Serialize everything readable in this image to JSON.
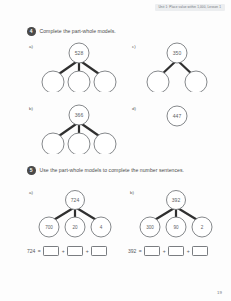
{
  "header": {
    "running_head": "Unit 1: Place value within 1,000, Lesson 1"
  },
  "footer": {
    "page_number": "19"
  },
  "questions": [
    {
      "number": "4",
      "instruction": "Complete the part-whole models.",
      "parts": [
        {
          "letter": "a)",
          "whole": "528",
          "parts_count": 3,
          "part_values": [
            "",
            "",
            ""
          ]
        },
        {
          "letter": "b)",
          "whole": "366",
          "parts_count": 3,
          "part_values": [
            "",
            "",
            ""
          ]
        },
        {
          "letter": "c)",
          "whole": "350",
          "parts_count": 2,
          "part_values": [
            "",
            ""
          ]
        },
        {
          "letter": "d)",
          "whole": "447",
          "parts_count": 0,
          "part_values": []
        }
      ]
    },
    {
      "number": "5",
      "instruction": "Use the part-whole models to complete the number sentences.",
      "parts": [
        {
          "letter": "a)",
          "whole": "724",
          "parts_count": 3,
          "part_values": [
            "700",
            "20",
            "4"
          ],
          "sentence": {
            "left": "724",
            "equals": "=",
            "plus": "+",
            "blanks": 3
          }
        },
        {
          "letter": "b)",
          "whole": "392",
          "parts_count": 3,
          "part_values": [
            "300",
            "90",
            "2"
          ],
          "sentence": {
            "left": "392",
            "equals": "=",
            "plus": "+",
            "blanks": 3
          }
        }
      ]
    }
  ],
  "colors": {
    "ink": "#3a3a3a",
    "circle_stroke": "#6f7276",
    "connector": "#2f2f2f",
    "badge": "#4a4a4a",
    "header_band": "#eceef0"
  }
}
